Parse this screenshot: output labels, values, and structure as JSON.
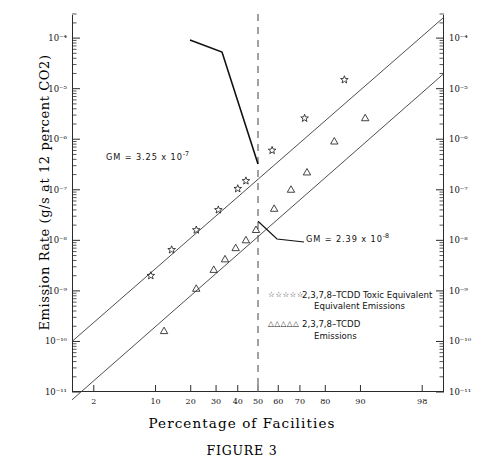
{
  "figure": {
    "caption": "FIGURE 3",
    "xlabel": "Percentage of Facilities",
    "ylabel": "Emission Rate (g/s at 12 percent CO2)"
  },
  "annotations": {
    "gm_upper": {
      "prefix": "GM  =  3.25  x  10",
      "exponent": "-7"
    },
    "gm_lower": {
      "prefix": "GM  =  2.39  x  10",
      "exponent": "-8"
    }
  },
  "legend": {
    "entries": [
      {
        "marker": "☆☆☆☆☆",
        "line1": "2,3,7,8–TCDD Toxic Equivalent",
        "line2": "Equivalent Emissions"
      },
      {
        "marker": "△△△△△",
        "line1": "2,3,7,8–TCDD",
        "line2": "Emissions"
      }
    ]
  },
  "chart_data": {
    "type": "scatter",
    "title": "FIGURE 3",
    "xlabel": "Percentage of Facilities",
    "ylabel": "Emission Rate (g/s at 12 percent CO2)",
    "x_scale": "probability",
    "y_scale": "log10",
    "xlim": [
      1,
      99
    ],
    "ylim": [
      1e-11,
      0.0003
    ],
    "grid": false,
    "legend_position": "inside-bottom-right",
    "xticks": [
      2,
      10,
      20,
      30,
      40,
      50,
      60,
      70,
      80,
      90,
      98
    ],
    "xticklabels": [
      "2",
      "10",
      "20",
      "30",
      "40",
      "50",
      "60",
      "70",
      "80",
      "90",
      "98"
    ],
    "yticks": [
      0.0001,
      1e-05,
      1e-06,
      1e-07,
      1e-08,
      1e-09,
      1e-10,
      1e-11
    ],
    "yticklabels": [
      "10⁻⁴",
      "10⁻⁵",
      "10⁻⁶",
      "10⁻⁷",
      "10⁻⁸",
      "10⁻⁹",
      "10⁻¹⁰",
      "10⁻¹¹"
    ],
    "reference_line": {
      "x": 50,
      "style": "dashed",
      "label": "median"
    },
    "series": [
      {
        "name": "2,3,7,8-TCDD Toxic Equivalent Equivalent Emissions",
        "marker": "star",
        "geometric_mean": 3.25e-07,
        "points": [
          {
            "x": 9,
            "y": 2e-09
          },
          {
            "x": 14,
            "y": 6.5e-09
          },
          {
            "x": 22,
            "y": 1.6e-08
          },
          {
            "x": 31,
            "y": 4e-08
          },
          {
            "x": 40,
            "y": 1.05e-07
          },
          {
            "x": 44,
            "y": 1.5e-07
          },
          {
            "x": 57,
            "y": 6e-07
          },
          {
            "x": 72,
            "y": 2.6e-06
          },
          {
            "x": 86,
            "y": 1.5e-05
          }
        ],
        "fit_line": {
          "x1": 1,
          "y1": 1e-10,
          "x2": 99,
          "y2": 0.00026
        }
      },
      {
        "name": "2,3,7,8-TCDD Emissions",
        "marker": "triangle",
        "geometric_mean": 2.39e-08,
        "points": [
          {
            "x": 12,
            "y": 1.6e-10
          },
          {
            "x": 22,
            "y": 1.1e-09
          },
          {
            "x": 29,
            "y": 2.6e-09
          },
          {
            "x": 34,
            "y": 4.2e-09
          },
          {
            "x": 39,
            "y": 7e-09
          },
          {
            "x": 44,
            "y": 1e-08
          },
          {
            "x": 49,
            "y": 1.6e-08
          },
          {
            "x": 58,
            "y": 4.2e-08
          },
          {
            "x": 66,
            "y": 1e-07
          },
          {
            "x": 73,
            "y": 2.2e-07
          },
          {
            "x": 83,
            "y": 9e-07
          },
          {
            "x": 91,
            "y": 2.6e-06
          }
        ],
        "fit_line": {
          "x1": 1,
          "y1": 7e-12,
          "x2": 99,
          "y2": 2e-05
        }
      }
    ]
  }
}
